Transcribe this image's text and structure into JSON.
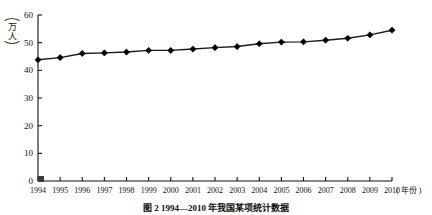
{
  "figure": {
    "y_axis_unit_chars": [
      "万",
      "人"
    ],
    "x_axis_unit": "( 年份 )",
    "caption": "图 2  1994—2010 年我国某项统计数据"
  },
  "chart_data": {
    "type": "line",
    "title": "",
    "xlabel": "年份",
    "ylabel": "万人",
    "xlim": [
      1994,
      2010
    ],
    "ylim": [
      0,
      60
    ],
    "yticks": [
      0,
      10,
      20,
      30,
      40,
      50,
      60
    ],
    "grid": false,
    "legend": "none",
    "marker": "diamond",
    "categories": [
      "1994",
      "1995",
      "1996",
      "1997",
      "1998",
      "1999",
      "2000",
      "2001",
      "2002",
      "2003",
      "2004",
      "2005",
      "2006",
      "2007",
      "2008",
      "2009",
      "2010"
    ],
    "values": [
      43.8,
      44.6,
      46.1,
      46.3,
      46.6,
      47.2,
      47.2,
      47.7,
      48.2,
      48.6,
      49.6,
      50.2,
      50.3,
      50.9,
      51.6,
      52.8,
      54.5
    ],
    "series": [
      {
        "name": "人数",
        "values": [
          43.8,
          44.6,
          46.1,
          46.3,
          46.6,
          47.2,
          47.2,
          47.7,
          48.2,
          48.6,
          49.6,
          50.2,
          50.3,
          50.9,
          51.6,
          52.8,
          54.5
        ]
      }
    ]
  },
  "colors": {
    "line": "#1a1a1a",
    "marker": "#000000",
    "axis": "#111111",
    "background": "#ffffff"
  }
}
